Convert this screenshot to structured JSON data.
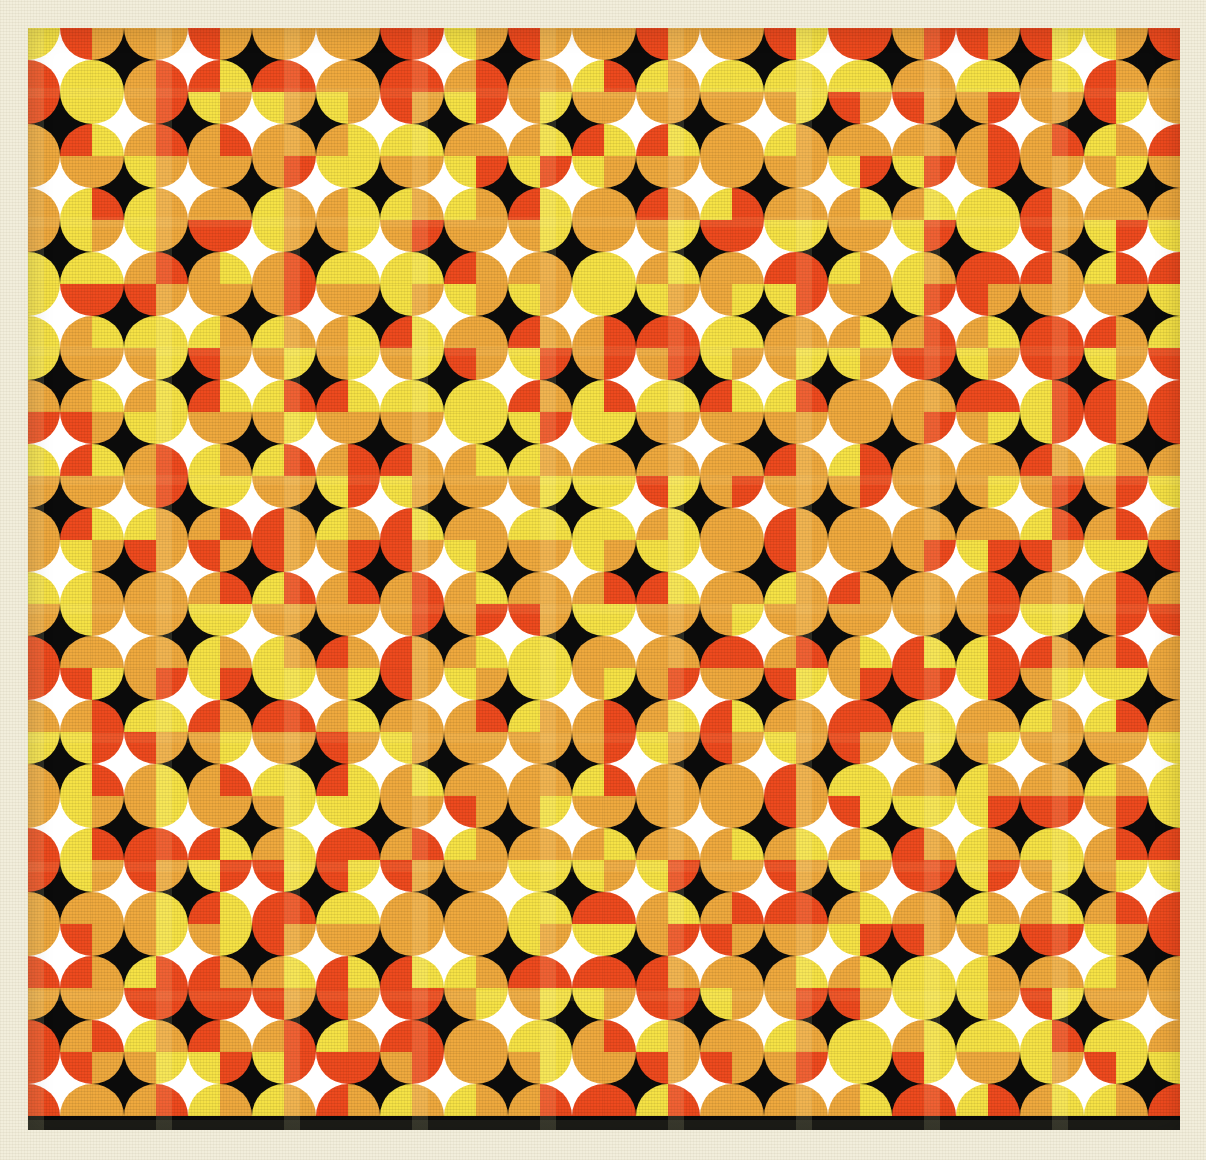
{
  "artwork": {
    "title": "Quarter-Circle Op-Art Tiling",
    "medium": "screenprint on paper",
    "background_color": "#f2eedc",
    "plate": {
      "x": 28,
      "y": 28,
      "width": 1152,
      "height": 1102,
      "border_color": "#0b0b0b"
    },
    "grid": {
      "columns": 18,
      "rows": 17,
      "cell_size": 64,
      "cell_backgrounds": [
        "#ffffff",
        "#0b0b0b"
      ],
      "checkerboard": true
    },
    "palette": {
      "orange": "#efa93e",
      "red": "#ee4a1e",
      "yellow": "#f6e245",
      "white": "#ffffff",
      "black": "#0b0b0b",
      "paper": "#f2eedc"
    },
    "motif": {
      "shape": "quarter-circle",
      "per_cell": 4,
      "corners": [
        "tl",
        "tr",
        "bl",
        "br"
      ],
      "radius_ratio": 0.5,
      "note": "Adjacent quarter-circles meet at grid nodes to read as full circles; untouched cell centres form four-pointed stars."
    },
    "color_field": {
      "keys": [
        "orange",
        "red",
        "yellow"
      ],
      "seed": 20240117,
      "weights": [
        0.46,
        0.25,
        0.29
      ]
    }
  },
  "chart_data": {
    "type": "heatmap",
    "xlabel": "",
    "ylabel": "",
    "categories": [
      "orange",
      "red",
      "yellow"
    ],
    "values": [
      0.46,
      0.25,
      0.29
    ],
    "grid": true,
    "legend": "none"
  }
}
